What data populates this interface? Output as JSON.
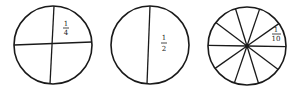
{
  "diagram": {
    "circles": [
      {
        "name": "quarters",
        "parts": 4,
        "label_numerator": "1",
        "label_denominator": "4"
      },
      {
        "name": "halves",
        "parts": 2,
        "label_numerator": "1",
        "label_denominator": "2"
      },
      {
        "name": "tenths",
        "parts": 10,
        "label_numerator": "1",
        "label_denominator": "10"
      }
    ]
  }
}
